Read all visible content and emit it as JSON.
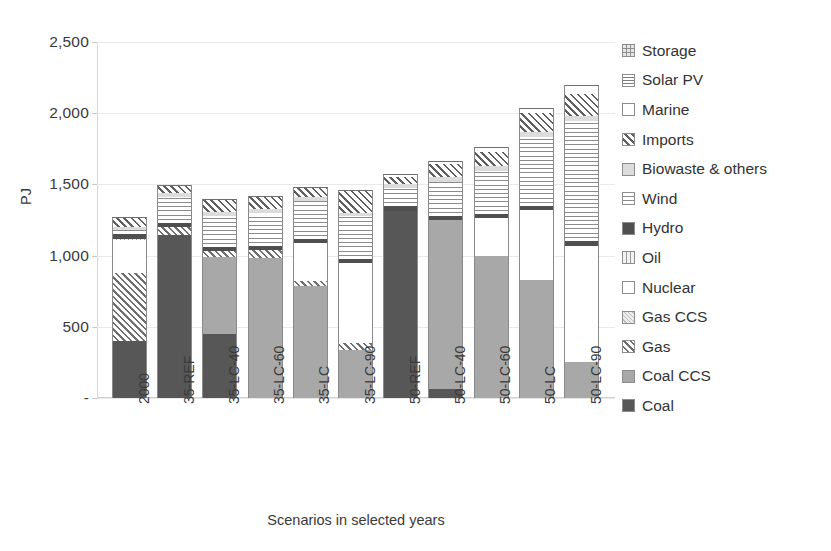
{
  "chart_data": {
    "type": "bar",
    "subtype": "stacked-bar",
    "title": "",
    "xlabel": "Scenarios in selected years",
    "ylabel": "PJ",
    "ylim": [
      0,
      2500
    ],
    "yticks": [
      "-",
      "500",
      "1,000",
      "1,500",
      "2,000",
      "2,500"
    ],
    "ytick_values": [
      0,
      500,
      1000,
      1500,
      2000,
      2500
    ],
    "grid": true,
    "legend_position": "right",
    "categories": [
      "2000",
      "35-REF",
      "35-LC-40",
      "35-LC-60",
      "35-LC",
      "35-LC-90",
      "50-REF",
      "50-LC-40",
      "50-LC-60",
      "50-LC",
      "50-LC-90"
    ],
    "series": [
      {
        "name": "Coal",
        "pattern": "solid-dark-gray",
        "values": [
          400,
          1145,
          450,
          0,
          0,
          0,
          1315,
          65,
          0,
          0,
          0
        ]
      },
      {
        "name": "Coal CCS",
        "pattern": "solid-light-gray",
        "values": [
          0,
          0,
          540,
          985,
          790,
          340,
          0,
          1185,
          995,
          830,
          250
        ]
      },
      {
        "name": "Gas",
        "pattern": "diagonal-hatch",
        "values": [
          480,
          55,
          40,
          55,
          35,
          45,
          0,
          0,
          0,
          0,
          0
        ]
      },
      {
        "name": "Gas CCS",
        "pattern": "crosshatch-light",
        "values": [
          0,
          0,
          0,
          0,
          0,
          0,
          0,
          0,
          0,
          0,
          0
        ]
      },
      {
        "name": "Nuclear",
        "pattern": "white",
        "values": [
          230,
          0,
          0,
          0,
          265,
          560,
          0,
          0,
          270,
          490,
          820
        ]
      },
      {
        "name": "Oil",
        "pattern": "vertical-lines",
        "values": [
          10,
          0,
          0,
          0,
          0,
          0,
          0,
          0,
          0,
          0,
          0
        ]
      },
      {
        "name": "Hydro",
        "pattern": "solid-darkest",
        "values": [
          30,
          30,
          30,
          30,
          30,
          30,
          30,
          30,
          30,
          30,
          30
        ]
      },
      {
        "name": "Wind",
        "pattern": "horizontal-lines",
        "values": [
          30,
          185,
          220,
          230,
          265,
          300,
          130,
          240,
          300,
          480,
          845
        ]
      },
      {
        "name": "Biowaste & others",
        "pattern": "solid-very-light",
        "values": [
          20,
          25,
          25,
          25,
          25,
          25,
          30,
          30,
          35,
          35,
          35
        ]
      },
      {
        "name": "Imports",
        "pattern": "diagonal-hatch-dense",
        "values": [
          70,
          55,
          90,
          95,
          75,
          160,
          50,
          95,
          100,
          140,
          155
        ]
      },
      {
        "name": "Marine",
        "pattern": "white-outline",
        "values": [
          0,
          0,
          0,
          0,
          0,
          0,
          20,
          20,
          30,
          30,
          60
        ]
      },
      {
        "name": "Solar PV",
        "pattern": "grid-fine",
        "values": [
          0,
          0,
          0,
          0,
          0,
          0,
          0,
          0,
          0,
          0,
          0
        ]
      },
      {
        "name": "Storage",
        "pattern": "grid-coarse",
        "values": [
          0,
          0,
          0,
          0,
          0,
          0,
          0,
          0,
          0,
          0,
          0
        ]
      }
    ],
    "totals": [
      1270,
      1495,
      1395,
      1420,
      1485,
      1460,
      1575,
      1665,
      1730,
      2035,
      2195
    ]
  },
  "legend": {
    "items": [
      {
        "label": "Storage",
        "key": "storage"
      },
      {
        "label": "Solar PV",
        "key": "solarpv"
      },
      {
        "label": "Marine",
        "key": "marine"
      },
      {
        "label": "Imports",
        "key": "imports"
      },
      {
        "label": "Biowaste & others",
        "key": "biowaste"
      },
      {
        "label": "Wind",
        "key": "wind"
      },
      {
        "label": "Hydro",
        "key": "hydro"
      },
      {
        "label": "Oil",
        "key": "oil"
      },
      {
        "label": "Nuclear",
        "key": "nuclear"
      },
      {
        "label": "Gas CCS",
        "key": "gasccs"
      },
      {
        "label": "Gas",
        "key": "gas"
      },
      {
        "label": "Coal CCS",
        "key": "coalccs"
      },
      {
        "label": "Coal",
        "key": "coal"
      }
    ]
  },
  "colors": {
    "coal": "#575757",
    "coal_ccs": "#a8a8a8",
    "hydro": "#4f4f4f",
    "biowaste": "#dcdcdc",
    "gridline": "#e9e9e9",
    "text": "#3a3a3a",
    "background": "#ffffff"
  }
}
